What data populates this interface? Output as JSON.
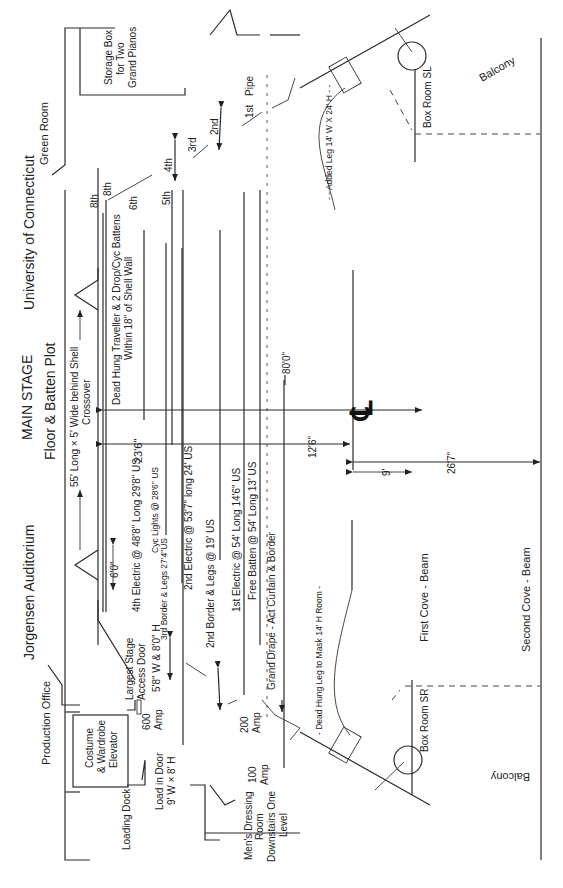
{
  "titles": {
    "venue": "Jorgensen Auditorium",
    "stage": "MAIN STAGE",
    "plot": "Floor & Batten Plot",
    "university": "University of Connecticut"
  },
  "rooms": {
    "green_room": "Green Room",
    "storage_l1": "Storage Box",
    "storage_l2": "for Two",
    "storage_l3": "Grand Pianos",
    "production_office": "Production Office",
    "elevator_l1": "Costume",
    "elevator_l2": "& Wardrobe",
    "elevator_l3": "Elevator",
    "loading_dock": "Loading Dock",
    "load_door_l1": "Load in Door",
    "load_door_l2": "9' W × 8' H",
    "mens_l1": "Men's Dressing",
    "mens_l2": "Room",
    "mens_l3": "Downstairs One",
    "mens_l4": "Level",
    "box_room_sl": "Box Room SL",
    "box_room_sr": "Box Room SR",
    "balcony_sl": "Balcony",
    "balcony_sr": "Balcony",
    "first_cove": "First Cove - Beam",
    "second_cove": "Second Cove - Beam"
  },
  "power": {
    "amp600_l1": "600",
    "amp600_l2": "Amp",
    "amp200_l1": "200",
    "amp200_l2": "Amp",
    "amp100_l1": "100",
    "amp100_l2": "Amp"
  },
  "access_door": {
    "l1": "Largest Stage",
    "l2": "Access Door",
    "l3": "5'8\" W & 8'0\" H"
  },
  "crossover": {
    "l1": "55' Long × 5' Wide behind Shell",
    "l2": "Crossover"
  },
  "battens": {
    "dead_hung_l1": "Dead Hung Traveller & 2 Drop/Cyc Battens",
    "dead_hung_l2": "Within 18\" of Shell Wall",
    "fourth_electric": "4th Electric @ 48'8\" Long 29'8\" US",
    "cyc_lights": "Cyc Lights @ 28'6\" US",
    "third_border": "3rd Border & Legs 27'4\"US",
    "second_electric": "2nd Electric @ 53'7\" long 24' US",
    "second_border": "2nd Border & Legs @ 19' US",
    "first_electric": "1st Electric @ 54' Long 14'6\" US",
    "free_batten": "Free Batten @ 54' Long 13' US",
    "grand_drape": "Grand Drape - Act Curtain & Border",
    "dead_hung_leg": "- Dead Hung Leg to Mask 14' H Room -",
    "added_leg": "- - Added Leg 14' W X 24' H - -"
  },
  "pipes": {
    "first": "1st",
    "pipe": "Pipe",
    "second": "2nd",
    "third": "3rd",
    "fourth": "4th",
    "fifth": "5th",
    "sixth": "6th",
    "eighth_a": "8th",
    "eighth_b": "8th"
  },
  "dimensions": {
    "d_6_0": "6'0\"",
    "d_23_6": "23'6\"",
    "d_80_0": "80'0\"",
    "d_12_6": "12'6\"",
    "d_9": "9'",
    "d_26_7": "26'7\"",
    "centerline": "℄"
  }
}
